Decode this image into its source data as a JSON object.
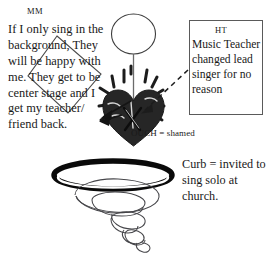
{
  "canvas": {
    "width": 267,
    "height": 260,
    "background": "#ffffff",
    "ink": "#191919",
    "heart_fill": "#262626",
    "box_border": "#5a5a5a"
  },
  "labels": {
    "mm_tag": "MM",
    "ht_tag": "HT"
  },
  "mm_note": {
    "text": "If I only sing in the background, They will be happy with me. They get to be center stage and I get my teacher/ friend back."
  },
  "ht_note": {
    "text": "Music Teacher changed lead singer for no reason"
  },
  "ouch_note": {
    "text": "OUCH = shamed"
  },
  "curb_note": {
    "text": "Curb = invited to sing solo at church."
  },
  "figures": {
    "balloon": "balloon-circle",
    "stem": "balloon-stem-line",
    "heart": "broken-heart-shape",
    "heart_mark": "x-mark",
    "impact_rays": "impact-burst-rays",
    "diamond": "diamond-outline",
    "arrow_to_mm": "solid-arrow-left",
    "arrow_from_ht": "dashed-arrow",
    "ring": "thick-black-ellipse-ring",
    "funnel": "spiral-funnel-coil"
  }
}
